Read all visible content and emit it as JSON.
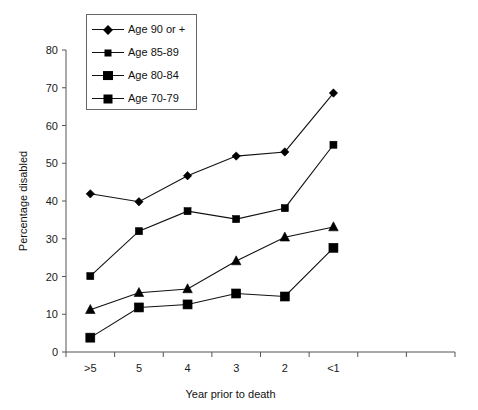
{
  "chart_data": {
    "type": "line",
    "title": "",
    "xlabel": "Year prior to death",
    "ylabel": "Percentage disabled",
    "categories": [
      ">5",
      "5",
      "4",
      "3",
      "2",
      "<1"
    ],
    "ylim": [
      0,
      80
    ],
    "yticks": [
      0,
      10,
      20,
      30,
      40,
      50,
      60,
      70,
      80
    ],
    "grid": false,
    "legend_position": "top-left-inside",
    "series": [
      {
        "name": "Age 90 or +",
        "marker": "diamond",
        "color": "#000000",
        "values": [
          41.9,
          39.8,
          46.7,
          51.9,
          53.0,
          68.6
        ]
      },
      {
        "name": "Age 85-89",
        "marker": "square-small",
        "color": "#000000",
        "values": [
          20.1,
          32.0,
          37.3,
          35.2,
          38.1,
          54.9
        ]
      },
      {
        "name": "Age 80-84",
        "marker": "triangle",
        "color": "#000000",
        "values": [
          11.2,
          15.7,
          16.7,
          24.1,
          30.4,
          33.1
        ]
      },
      {
        "name": "Age 70-79",
        "marker": "square-large",
        "color": "#000000",
        "values": [
          3.8,
          11.8,
          12.6,
          15.5,
          14.7,
          27.6
        ]
      }
    ]
  },
  "legend": {
    "items": [
      {
        "label": "Age 90 or +",
        "marker": "diamond"
      },
      {
        "label": "Age 85-89",
        "marker": "square-small"
      },
      {
        "label": "Age 80-84",
        "marker": "triangle"
      },
      {
        "label": "Age 70-79",
        "marker": "square-large"
      }
    ]
  },
  "axes": {
    "y_title": "Percentage disabled",
    "x_title": "Year prior to death",
    "y_tick_labels": [
      "0",
      "10",
      "20",
      "30",
      "40",
      "50",
      "60",
      "70",
      "80"
    ],
    "x_tick_labels": [
      ">5",
      "5",
      "4",
      "3",
      "2",
      "<1"
    ]
  }
}
